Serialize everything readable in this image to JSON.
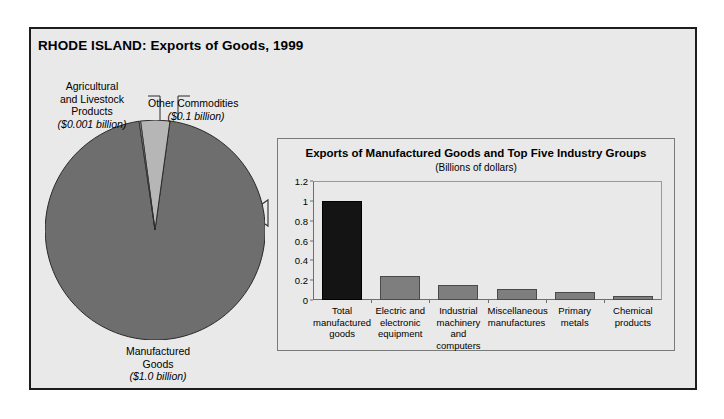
{
  "header": {
    "title": "RHODE ISLAND: Exports of Goods, 1999"
  },
  "pie_labels": {
    "agricultural": {
      "line1": "Agricultural",
      "line2": "and Livestock",
      "line3": "Products",
      "value": "($0.001 billion)"
    },
    "other": {
      "line1": "Other Commodities",
      "value": "($0.1 billion)"
    },
    "manufactured": {
      "line1": "Manufactured",
      "line2": "Goods",
      "value": "($1.0 billion)"
    }
  },
  "colors": {
    "panel_background": "#e9e9e9",
    "panel_border": "#1d1d1d",
    "pie_major": "#6e6e6e",
    "pie_minor": "#b6b6b6",
    "bar_gray": "#7e7e7e",
    "bar_dark": "#141414",
    "axis": "#6e6e6e"
  },
  "chart_data": [
    {
      "type": "pie",
      "title": "RHODE ISLAND: Exports of Goods, 1999",
      "unit": "Billions of dollars",
      "categories": [
        "Manufactured Goods",
        "Other Commodities",
        "Agricultural and Livestock Products"
      ],
      "values": [
        1.0,
        0.1,
        0.001
      ],
      "labels": [
        "($1.0 billion)",
        "($0.1 billion)",
        "($0.001 billion)"
      ],
      "legend": "none"
    },
    {
      "type": "bar",
      "title": "Exports of Manufactured Goods and Top Five Industry Groups",
      "subtitle": "(Billions of dollars)",
      "xlabel": "",
      "ylabel": "",
      "ylim": [
        0,
        1.2
      ],
      "yticks": [
        0,
        0.2,
        0.4,
        0.6,
        0.8,
        1,
        1.2
      ],
      "ytick_labels": [
        "0",
        "0.2",
        "0.4",
        "0.6",
        "0.8",
        "1",
        "1.2"
      ],
      "grid": false,
      "legend": "none",
      "categories": [
        "Total manufactured goods",
        "Electric and electronic equipment",
        "Industrial machinery and computers",
        "Miscellaneous manufactures",
        "Primary metals",
        "Chemical products"
      ],
      "category_lines": [
        [
          "Total",
          "manufactured",
          "goods"
        ],
        [
          "Electric and",
          "electronic",
          "equipment"
        ],
        [
          "Industrial",
          "machinery and",
          "computers"
        ],
        [
          "Miscellaneous",
          "manufactures"
        ],
        [
          "Primary",
          "metals"
        ],
        [
          "Chemical",
          "products"
        ]
      ],
      "values": [
        1.0,
        0.24,
        0.15,
        0.11,
        0.08,
        0.04
      ],
      "bar_colors": [
        "#141414",
        "#7e7e7e",
        "#7e7e7e",
        "#7e7e7e",
        "#7e7e7e",
        "#7e7e7e"
      ]
    }
  ]
}
